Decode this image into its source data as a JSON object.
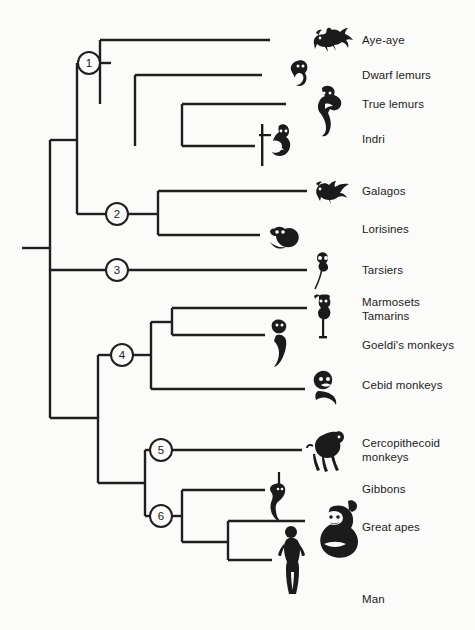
{
  "figure": {
    "type": "phylogenetic-cladogram",
    "background_color": "#fbfbfa",
    "line_color": "#1f1f1f",
    "text_color": "#1c1c1c"
  },
  "nodes": [
    {
      "id": "1",
      "label": "1",
      "cx": 89,
      "cy": 63,
      "r": 11
    },
    {
      "id": "2",
      "label": "2",
      "cx": 117,
      "cy": 214,
      "r": 11
    },
    {
      "id": "3",
      "label": "3",
      "cx": 117,
      "cy": 270,
      "r": 11
    },
    {
      "id": "4",
      "label": "4",
      "cx": 122,
      "cy": 355,
      "r": 11
    },
    {
      "id": "5",
      "label": "5",
      "cx": 161,
      "cy": 450,
      "r": 11
    },
    {
      "id": "6",
      "label": "6",
      "cx": 161,
      "cy": 516,
      "r": 11
    }
  ],
  "taxa": [
    {
      "id": "aye-aye",
      "label": "Aye-aye",
      "tip_x": 270,
      "y": 40,
      "label_x": 362,
      "label_y": 34,
      "icon": "aye-aye-icon"
    },
    {
      "id": "dwarf-lemurs",
      "label": "Dwarf lemurs",
      "tip_x": 262,
      "y": 75,
      "label_x": 362,
      "label_y": 69,
      "icon": "dwarf-lemur-icon"
    },
    {
      "id": "true-lemurs",
      "label": "True lemurs",
      "tip_x": 286,
      "y": 104,
      "label_x": 362,
      "label_y": 98,
      "icon": "true-lemur-icon"
    },
    {
      "id": "indri",
      "label": "Indri",
      "tip_x": 255,
      "y": 146,
      "label_x": 362,
      "label_y": 133,
      "icon": "indri-icon"
    },
    {
      "id": "galagos",
      "label": "Galagos",
      "tip_x": 307,
      "y": 191,
      "label_x": 362,
      "label_y": 185,
      "icon": "galago-icon"
    },
    {
      "id": "lorisines",
      "label": "Lorisines",
      "tip_x": 260,
      "y": 235,
      "label_x": 362,
      "label_y": 223,
      "icon": "lorisine-icon"
    },
    {
      "id": "tarsiers",
      "label": "Tarsiers",
      "tip_x": 307,
      "y": 270,
      "label_x": 362,
      "label_y": 264,
      "icon": "tarsier-icon"
    },
    {
      "id": "marmosets-tamarins",
      "label": "Marmosets\nTamarins",
      "tip_x": 307,
      "y": 308,
      "label_x": 362,
      "label_y": 296,
      "icon": "marmoset-icon"
    },
    {
      "id": "goeldis-monkeys",
      "label": "Goeldi's monkeys",
      "tip_x": 265,
      "y": 335,
      "label_x": 362,
      "label_y": 339,
      "icon": "goeldis-monkey-icon"
    },
    {
      "id": "cebid-monkeys",
      "label": "Cebid monkeys",
      "tip_x": 305,
      "y": 389,
      "label_x": 362,
      "label_y": 379,
      "icon": "cebid-monkey-icon"
    },
    {
      "id": "cercopithecoid-monkeys",
      "label": "Cercopithecoid\nmonkeys",
      "tip_x": 302,
      "y": 450,
      "label_x": 362,
      "label_y": 437,
      "icon": "cercopithecoid-monkey-icon"
    },
    {
      "id": "gibbons",
      "label": "Gibbons",
      "tip_x": 265,
      "y": 490,
      "label_x": 362,
      "label_y": 483,
      "icon": "gibbon-icon"
    },
    {
      "id": "great-apes",
      "label": "Great apes",
      "tip_x": 305,
      "y": 521,
      "label_x": 362,
      "label_y": 521,
      "icon": "great-ape-icon"
    },
    {
      "id": "man",
      "label": "Man",
      "tip_x": 272,
      "y": 560,
      "label_x": 362,
      "label_y": 593,
      "icon": "man-icon"
    }
  ],
  "edges": {
    "root_stub": {
      "x1": 22,
      "x2": 50,
      "y": 248
    },
    "trunk": {
      "x": 50,
      "y1": 140,
      "y2": 418
    },
    "strepsirrhine_spine": {
      "x": 77,
      "y1": 63,
      "y2": 214
    },
    "strepsirrhine_to_trunk": {
      "x1": 50,
      "x2": 77,
      "y": 140
    },
    "lemuriform_spine": {
      "x": 100,
      "y1": 40,
      "y2": 104
    },
    "node1_to_lemuriform": {
      "x1": 100,
      "x2": 111,
      "y": 63
    },
    "node1_stub_left": {
      "x1": 77,
      "x2": 78,
      "y": 63
    },
    "cheirogaleid_spine": {
      "x": 135,
      "y1": 75,
      "y2": 146
    },
    "indrid_spine": {
      "x": 182,
      "y1": 104,
      "y2": 146
    },
    "node2_in": {
      "x1": 77,
      "x2": 106,
      "y": 214
    },
    "node2_out": {
      "x1": 128,
      "x2": 158,
      "y": 214
    },
    "lorisiform_spine": {
      "x": 158,
      "y1": 191,
      "y2": 235
    },
    "node3_in": {
      "x1": 50,
      "x2": 106,
      "y": 270
    },
    "node3_out": {
      "x1": 128,
      "x2": 307,
      "y": 270
    },
    "anthropoid_spine": {
      "x": 98,
      "y1": 355,
      "y2": 483
    },
    "anthropoid_to_trunk": {
      "x1": 50,
      "x2": 98,
      "y": 418
    },
    "node4_in": {
      "x1": 98,
      "x2": 111,
      "y": 355
    },
    "node4_out": {
      "x1": 133,
      "x2": 151,
      "y": 355
    },
    "platyrrhine_spine": {
      "x": 151,
      "y1": 322,
      "y2": 389
    },
    "callitrichid_branch": {
      "x1": 151,
      "x2": 172,
      "y": 322
    },
    "callitrichid_spine": {
      "x": 172,
      "y1": 308,
      "y2": 335
    },
    "catarrhine_spine": {
      "x": 145,
      "y1": 450,
      "y2": 516
    },
    "catarrhine_to_anthropoid": {
      "x1": 98,
      "x2": 145,
      "y": 483
    },
    "node5_in": {
      "x1": 145,
      "x2": 150,
      "y": 450
    },
    "node5_out": {
      "x1": 172,
      "x2": 302,
      "y": 450
    },
    "node6_in": {
      "x1": 145,
      "x2": 150,
      "y": 516
    },
    "node6_out": {
      "x1": 172,
      "x2": 182,
      "y": 516
    },
    "hominoid_spine": {
      "x": 182,
      "y1": 490,
      "y2": 542
    },
    "hominid_branch": {
      "x1": 182,
      "x2": 228,
      "y": 542
    },
    "hominid_spine": {
      "x": 228,
      "y1": 521,
      "y2": 560
    }
  }
}
